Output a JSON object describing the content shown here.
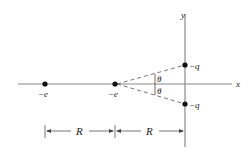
{
  "diagram": {
    "axes": {
      "x_label": "x",
      "y_label": "y"
    },
    "charges": [
      {
        "id": "left-electron",
        "label": "−e",
        "position": "x-axis, distance 2R left of origin"
      },
      {
        "id": "middle-electron",
        "label": "−e",
        "position": "x-axis, distance R left of origin"
      },
      {
        "id": "upper-charge",
        "label": "−q",
        "position": "positive y-axis"
      },
      {
        "id": "lower-charge",
        "label": "−q",
        "position": "negative y-axis"
      }
    ],
    "angles": [
      {
        "label": "θ",
        "between": "x-axis and line to upper −q"
      },
      {
        "label": "θ",
        "between": "x-axis and line to lower −q"
      }
    ],
    "dimensions": [
      {
        "label": "R",
        "from": "left −e",
        "to": "middle −e"
      },
      {
        "label": "R",
        "from": "middle −e",
        "to": "y-axis"
      }
    ],
    "colors": {
      "axis": "#8a8a8a",
      "dot": "#111111",
      "text": "#222222"
    }
  }
}
